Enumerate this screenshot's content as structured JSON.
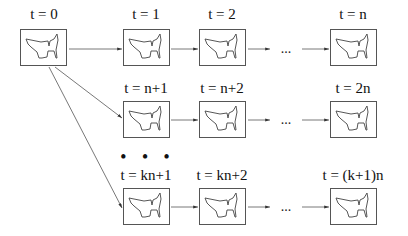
{
  "diagram": {
    "rows": [
      {
        "frames": [
          {
            "label": "t = 0"
          },
          {
            "label": "t = 1"
          },
          {
            "label": "t = 2"
          },
          {
            "label": "t = n"
          }
        ],
        "ellipsis": "..."
      },
      {
        "frames": [
          {
            "label": "t = n+1"
          },
          {
            "label": "t = n+2"
          },
          {
            "label": "t = 2n"
          }
        ],
        "ellipsis": "..."
      },
      {
        "frames": [
          {
            "label": "t = kn+1"
          },
          {
            "label": "t = kn+2"
          },
          {
            "label": "t = (k+1)n"
          }
        ],
        "ellipsis": "..."
      }
    ],
    "vertical_ellipsis": "• • •",
    "frame_content": "cat-silhouette-icon",
    "colors": {
      "line": "#555555",
      "text": "#111111",
      "background": "#ffffff"
    }
  }
}
